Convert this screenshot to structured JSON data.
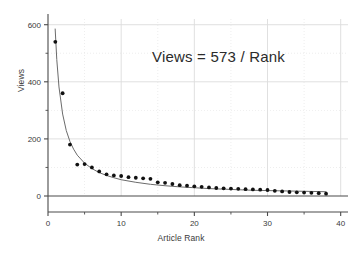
{
  "chart_data": {
    "type": "scatter",
    "title": "",
    "xlabel": "Article Rank",
    "ylabel": "Views",
    "xlim": [
      0,
      41
    ],
    "ylim": [
      0,
      620
    ],
    "grid": true,
    "legend": "none",
    "annotations": [
      {
        "text": "Views = 573 / Rank",
        "x": 20,
        "y": 470
      }
    ],
    "x_major_ticks": [
      0,
      10,
      20,
      30,
      40
    ],
    "x_minor_ticks": [
      5,
      15,
      25,
      35
    ],
    "y_major_ticks": [
      0,
      200,
      400,
      600
    ],
    "y_minor_ticks": [
      100,
      300,
      500
    ],
    "x_tick_labels": [
      "0",
      "10",
      "20",
      "30",
      "40"
    ],
    "y_tick_labels": [
      "0",
      "200",
      "400",
      "600"
    ],
    "series": [
      {
        "name": "Views per article",
        "marker": "filled-circle",
        "color": "#111111",
        "x": [
          1,
          2,
          3,
          4,
          5,
          6,
          7,
          8,
          9,
          10,
          11,
          12,
          13,
          14,
          15,
          16,
          17,
          18,
          19,
          20,
          21,
          22,
          23,
          24,
          25,
          26,
          27,
          28,
          29,
          30,
          31,
          32,
          33,
          34,
          35,
          36,
          37,
          38
        ],
        "y": [
          540,
          360,
          180,
          110,
          112,
          100,
          86,
          76,
          72,
          70,
          66,
          64,
          62,
          60,
          48,
          46,
          42,
          38,
          36,
          34,
          32,
          30,
          28,
          27,
          26,
          25,
          24,
          23,
          22,
          21,
          18,
          16,
          14,
          13,
          12,
          11,
          10,
          8
        ]
      },
      {
        "name": "Fitted curve 573/Rank",
        "marker": "line",
        "color": "#6b6b6b",
        "formula_numerator": 573,
        "x": [
          0.98,
          1.2,
          1.5,
          2,
          2.5,
          3,
          3.5,
          4,
          5,
          6,
          7,
          8,
          9,
          10,
          12,
          14,
          16,
          18,
          20,
          22,
          24,
          26,
          28,
          30,
          32,
          34,
          36,
          38
        ],
        "y": [
          585,
          478,
          382,
          287,
          229,
          191,
          164,
          143,
          115,
          96,
          82,
          72,
          64,
          57,
          48,
          41,
          36,
          32,
          29,
          26,
          24,
          22,
          20,
          19,
          18,
          17,
          16,
          15
        ]
      }
    ]
  },
  "axis": {
    "x_title": "Article Rank",
    "y_title": "Views"
  },
  "colors": {
    "background": "#ffffff",
    "axis_line": "#4a4a4a",
    "grid_line": "#dcdcdc",
    "grid_line_dotted": "#e2e2e2",
    "marker": "#111111",
    "curve": "#6b6b6b",
    "text": "#3a3a3a"
  }
}
